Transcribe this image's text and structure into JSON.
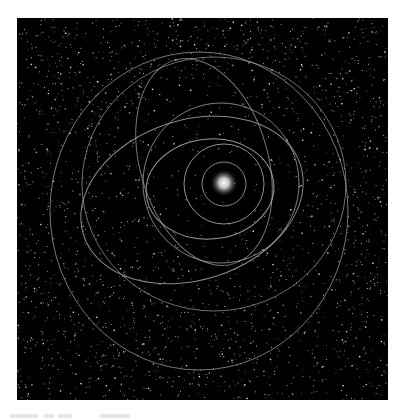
{
  "scene": {
    "description": "Star system orbital diagram on starfield",
    "background_color": "#000000",
    "orbit_color": "#b5b5b5",
    "star": {
      "cx": 224,
      "cy": 183,
      "glow_radius": 14,
      "color": "#ffffff"
    },
    "orbits": [
      {
        "name": "orbit-1",
        "cx": 224,
        "cy": 184,
        "rx": 22,
        "ry": 22,
        "rotate": 0,
        "opacity": 0.75
      },
      {
        "name": "orbit-2",
        "cx": 224,
        "cy": 184,
        "rx": 40,
        "ry": 40,
        "rotate": 0,
        "opacity": 0.8
      },
      {
        "name": "orbit-3",
        "cx": 210,
        "cy": 189,
        "rx": 64,
        "ry": 50,
        "rotate": -5,
        "opacity": 0.85
      },
      {
        "name": "orbit-4",
        "cx": 221,
        "cy": 183,
        "rx": 78,
        "ry": 80,
        "rotate": 0,
        "opacity": 0.7
      },
      {
        "name": "orbit-5",
        "cx": 192,
        "cy": 200,
        "rx": 114,
        "ry": 80,
        "rotate": -18,
        "opacity": 0.75
      },
      {
        "name": "orbit-6",
        "cx": 204,
        "cy": 162,
        "rx": 64,
        "ry": 106,
        "rotate": -16,
        "opacity": 0.65
      },
      {
        "name": "orbit-7",
        "cx": 214,
        "cy": 184,
        "rx": 132,
        "ry": 127,
        "rotate": 0,
        "opacity": 0.6
      },
      {
        "name": "orbit-8",
        "cx": 199,
        "cy": 211,
        "rx": 149,
        "ry": 159,
        "rotate": 0,
        "opacity": 0.65
      }
    ],
    "starfield": {
      "count": 2600,
      "seed": 7
    }
  },
  "caption": {
    "text": ""
  }
}
